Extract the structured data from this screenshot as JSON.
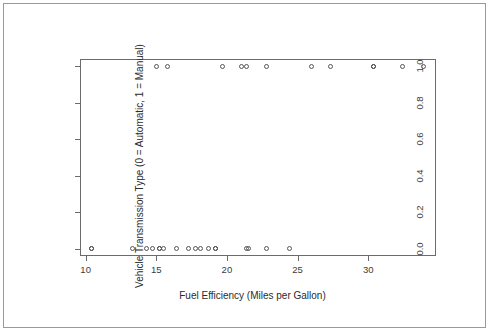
{
  "chart_data": {
    "type": "scatter",
    "title": "",
    "xlabel": "Fuel Efficiency (Miles per Gallon)",
    "ylabel": "Vehicle Transmission Type (0 = Automatic, 1 = Manual)",
    "xlim": [
      9.6,
      34.8
    ],
    "ylim": [
      -0.04,
      1.04
    ],
    "grid": false,
    "legend": null,
    "xticks": [
      10,
      15,
      20,
      25,
      30
    ],
    "xtick_labels": [
      "10",
      "15",
      "20",
      "25",
      "30"
    ],
    "yticks": [
      0.0,
      0.2,
      0.4,
      0.6,
      0.8,
      1.0
    ],
    "ytick_labels": [
      "0.0",
      "0.2",
      "0.4",
      "0.6",
      "0.8",
      "1.0"
    ],
    "marker": "open-circle",
    "marker_color": "#555555",
    "points": [
      {
        "x": 10.4,
        "y": 0
      },
      {
        "x": 10.4,
        "y": 0
      },
      {
        "x": 13.3,
        "y": 0
      },
      {
        "x": 14.3,
        "y": 0
      },
      {
        "x": 14.7,
        "y": 0
      },
      {
        "x": 15.0,
        "y": 1
      },
      {
        "x": 15.2,
        "y": 0
      },
      {
        "x": 15.2,
        "y": 0
      },
      {
        "x": 15.5,
        "y": 0
      },
      {
        "x": 15.8,
        "y": 1
      },
      {
        "x": 16.4,
        "y": 0
      },
      {
        "x": 17.3,
        "y": 0
      },
      {
        "x": 17.8,
        "y": 0
      },
      {
        "x": 18.1,
        "y": 0
      },
      {
        "x": 18.7,
        "y": 0
      },
      {
        "x": 19.2,
        "y": 0
      },
      {
        "x": 19.2,
        "y": 0
      },
      {
        "x": 19.7,
        "y": 1
      },
      {
        "x": 21.0,
        "y": 1
      },
      {
        "x": 21.4,
        "y": 0
      },
      {
        "x": 21.4,
        "y": 1
      },
      {
        "x": 21.5,
        "y": 0
      },
      {
        "x": 22.8,
        "y": 0
      },
      {
        "x": 22.8,
        "y": 1
      },
      {
        "x": 24.4,
        "y": 0
      },
      {
        "x": 26.0,
        "y": 1
      },
      {
        "x": 27.3,
        "y": 1
      },
      {
        "x": 30.4,
        "y": 1
      },
      {
        "x": 30.4,
        "y": 1
      },
      {
        "x": 32.4,
        "y": 1
      },
      {
        "x": 33.9,
        "y": 1
      }
    ]
  }
}
